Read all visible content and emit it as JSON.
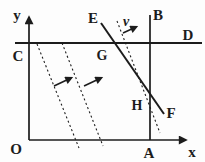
{
  "figure": {
    "background": "#fdfdfd",
    "ink_color": "#1c1c1c",
    "labels": {
      "axis_y": "y",
      "axis_x": "x",
      "origin": "O",
      "point_a": "A",
      "point_b": "B",
      "point_c": "C",
      "point_d": "D",
      "point_e": "E",
      "point_f": "F",
      "point_g": "G",
      "point_h": "H",
      "velocity": "v"
    }
  }
}
